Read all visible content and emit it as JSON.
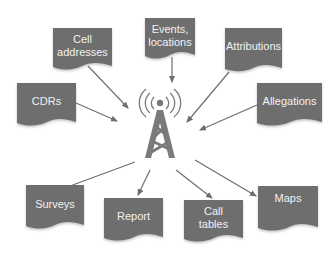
{
  "diagram": {
    "hub": {
      "name": "cell-tower",
      "icon": "cell-tower-icon"
    },
    "colors": {
      "box_fill": "#6e6e6e",
      "box_edge": "#d9d9d9",
      "arrow": "#6e6e6e",
      "tower": "#7a7a7a",
      "text": "#f2f2f2"
    },
    "inputs": [
      {
        "label": "Cell addresses"
      },
      {
        "label": "Events, locations"
      },
      {
        "label": "Attributions"
      },
      {
        "label": "CDRs"
      },
      {
        "label": "Allegations"
      }
    ],
    "outputs": [
      {
        "label": "Surveys"
      },
      {
        "label": "Report"
      },
      {
        "label": "Call tables"
      },
      {
        "label": "Maps"
      }
    ],
    "text": {
      "cell_addresses_l1": "Cell",
      "cell_addresses_l2": "addresses",
      "events_l1": "Events,",
      "events_l2": "locations",
      "attributions": "Attributions",
      "cdrs": "CDRs",
      "allegations": "Allegations",
      "surveys": "Surveys",
      "report": "Report",
      "call_tables_l1": "Call",
      "call_tables_l2": "tables",
      "maps": "Maps"
    }
  }
}
